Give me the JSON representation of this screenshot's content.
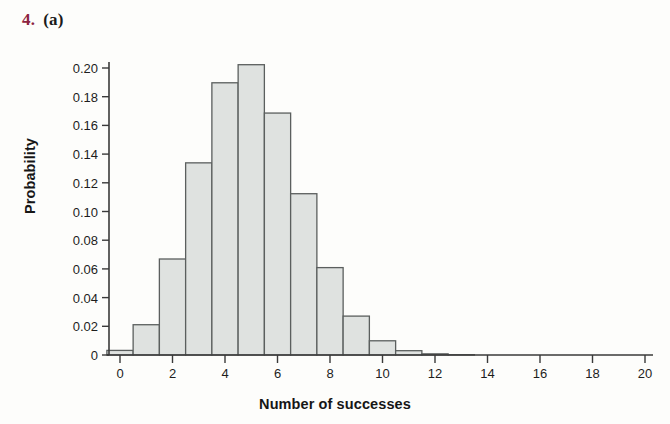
{
  "figure": {
    "number": "4.",
    "part": "(a)",
    "number_color": "#8c2340",
    "part_color": "#1a1a1a"
  },
  "style": {
    "page_background": "#fdfdfb",
    "bar_fill": "#dfe2e0",
    "bar_stroke": "#5b5f5e",
    "axis_color": "#3a3a3a",
    "text_color": "#1d1d1d"
  },
  "chart_data": {
    "type": "bar",
    "title": "",
    "subtitle": "",
    "xlabel": "Number of successes",
    "ylabel": "Probability",
    "xlim": [
      -0.5,
      20.5
    ],
    "ylim": [
      0,
      0.2023
    ],
    "grid": false,
    "legend": null,
    "x_tick_labels": [
      "0",
      "2",
      "4",
      "6",
      "8",
      "10",
      "12",
      "14",
      "16",
      "18",
      "20"
    ],
    "x_ticks": [
      0,
      2,
      4,
      6,
      8,
      10,
      12,
      14,
      16,
      18,
      20
    ],
    "y_tick_labels": [
      "0",
      "0.02",
      "0.04",
      "0.06",
      "0.08",
      "0.10",
      "0.12",
      "0.14",
      "0.16",
      "0.18",
      "0.20"
    ],
    "y_ticks": [
      0,
      0.02,
      0.04,
      0.06,
      0.08,
      0.1,
      0.12,
      0.14,
      0.16,
      0.18,
      0.2
    ],
    "categories": [
      0,
      1,
      2,
      3,
      4,
      5,
      6,
      7,
      8,
      9,
      10,
      11,
      12,
      13,
      14,
      15,
      16,
      17,
      18,
      19,
      20
    ],
    "values": [
      0.0032,
      0.0211,
      0.0669,
      0.1339,
      0.1897,
      0.2023,
      0.1686,
      0.1124,
      0.0609,
      0.0271,
      0.0099,
      0.003,
      0.0008,
      0.0002,
      0.0,
      0.0,
      0.0,
      0.0,
      0.0,
      0.0,
      0.0
    ],
    "bar_width": 1,
    "annotations": []
  }
}
